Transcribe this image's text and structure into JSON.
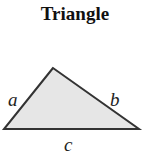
{
  "title": "Triangle",
  "diagram": {
    "shape": "triangle",
    "vertices": [
      [
        53,
        68
      ],
      [
        4,
        129
      ],
      [
        139,
        129
      ]
    ],
    "fill": "#e6e6e6",
    "stroke": "#333333",
    "labels": {
      "a": "a",
      "b": "b",
      "c": "c"
    }
  }
}
